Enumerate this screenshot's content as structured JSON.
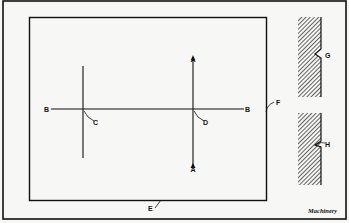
{
  "figure": {
    "labels": {
      "A_top": "A",
      "A_bottom": "A",
      "B_left": "B",
      "B_right": "B",
      "C": "C",
      "D": "D",
      "E": "E",
      "F": "F",
      "G": "G",
      "H": "H"
    },
    "credit": "Machinery",
    "colors": {
      "ink": "#111111",
      "paper": "#f7f7f5"
    }
  }
}
